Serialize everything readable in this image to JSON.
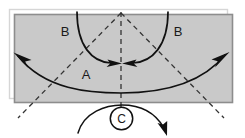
{
  "figure": {
    "type": "diagram",
    "title": "",
    "background_color": "#ffffff",
    "panel": {
      "fill_color": "#c9c9c9",
      "border_color": "#8a8a8a",
      "outer_outline_color": "#d8d8d8",
      "x": 14,
      "y": 14,
      "width": 218,
      "height": 89
    },
    "labels": {
      "arc_a": "A",
      "arc_b_left": "B",
      "arc_b_right": "B",
      "rotation_c": "C"
    },
    "line_color": "#1a1a1a",
    "dashed_color": "#3a3a3a",
    "elements": [
      {
        "name": "diagonal-dashed-left",
        "style": "dashed",
        "from": "top-center",
        "to": "bottom-left-beyond"
      },
      {
        "name": "diagonal-dashed-right",
        "style": "dashed",
        "from": "top-center",
        "to": "bottom-right-beyond"
      },
      {
        "name": "vertical-center-dashed",
        "style": "dashed",
        "from": "top-center",
        "to": "below-panel"
      },
      {
        "name": "arc-b-left",
        "style": "solid",
        "arrow": "end",
        "direction": "inward-to-center"
      },
      {
        "name": "arc-b-right",
        "style": "solid",
        "arrow": "end",
        "direction": "inward-to-center"
      },
      {
        "name": "arc-a",
        "style": "solid",
        "arrow": "both",
        "direction": "outward-left-and-right"
      },
      {
        "name": "rotation-arrow-c",
        "style": "solid",
        "arrow": "end",
        "direction": "clockwise"
      }
    ]
  }
}
